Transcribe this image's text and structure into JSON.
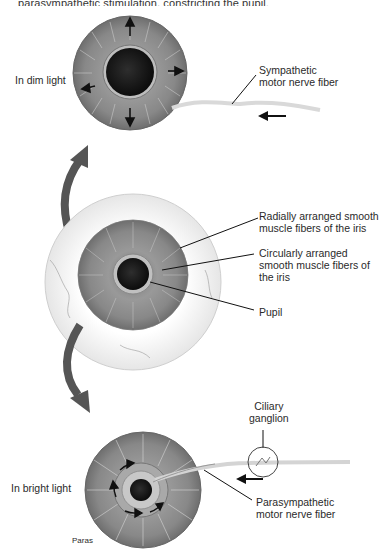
{
  "caption": {
    "text_partial": "parasympathetic stimulation, constricting the pupil."
  },
  "panels": {
    "dim": {
      "label": "In dim light",
      "nerve_label": [
        "Sympathetic",
        "motor nerve fiber"
      ]
    },
    "middle": {
      "labels": {
        "radial": [
          "Radially arranged smooth",
          "muscle fibers of the iris"
        ],
        "circular": [
          "Circularly arranged",
          "smooth muscle fibers of",
          "the iris"
        ],
        "pupil": "Pupil"
      }
    },
    "bright": {
      "label": "In bright light",
      "ganglion_label": [
        "Ciliary",
        "ganglion"
      ],
      "nerve_label": [
        "Parasympathetic",
        "motor nerve fiber"
      ],
      "corner_text": "Paras"
    }
  },
  "colors": {
    "iris": "#8a8a8a",
    "pupil": "#151515",
    "arrow_big": "#555555",
    "nerve": "#d8d8d8",
    "sclera": "#f4f4f4"
  }
}
